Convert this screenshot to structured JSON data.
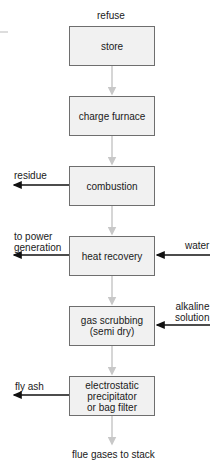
{
  "diagram": {
    "input_top": "refuse",
    "steps": [
      {
        "label": "store"
      },
      {
        "label": "charge furnace"
      },
      {
        "label": "combustion"
      },
      {
        "label": "heat recovery"
      },
      {
        "label": "gas scrubbing\n(semi dry)"
      },
      {
        "label": "electrostatic\nprecipitator\nor bag filter"
      }
    ],
    "outputs_left": {
      "residue": "residue",
      "power": "to power\ngeneration",
      "fly_ash": "fly ash"
    },
    "inputs_right": {
      "water": "water",
      "alkaline": "alkaline\nsolution"
    },
    "output_bottom": "flue gases to stack",
    "colors": {
      "box_fill": "#f1f1f1",
      "box_border": "#6e6e6e",
      "flow_arrow": "#c8c8c8",
      "side_arrow": "#111111"
    }
  }
}
